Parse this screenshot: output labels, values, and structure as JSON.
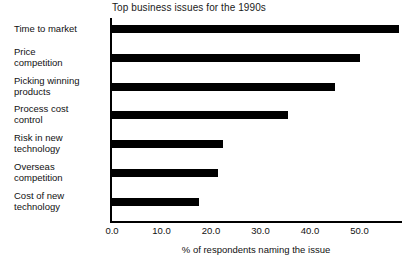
{
  "chart_data": {
    "type": "bar",
    "orientation": "horizontal",
    "title": "Top business issues for the 1990s",
    "xlabel": "% of respondents naming the issue",
    "ylabel": "",
    "categories": [
      "Time to market",
      "Price\ncompetition",
      "Picking winning\nproducts",
      "Process cost\ncontrol",
      "Risk in new\ntechnology",
      "Overseas\ncompetition",
      "Cost of new\ntechnology"
    ],
    "values": [
      58.0,
      50.0,
      45.0,
      35.5,
      22.5,
      21.5,
      17.5
    ],
    "xlim": [
      0,
      59
    ],
    "xticks": [
      0,
      10,
      20,
      30,
      40,
      50
    ],
    "xtick_labels": [
      "0.0",
      "10.0",
      "20.0",
      "30.0",
      "40.0",
      "50.0"
    ],
    "grid": false,
    "legend": null,
    "bar_color": "#000000",
    "background_color": "#ffffff"
  }
}
